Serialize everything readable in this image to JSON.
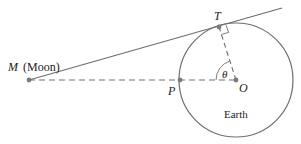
{
  "diagram": {
    "labels": {
      "moon_letter": "M",
      "moon_name": "(Moon)",
      "tangent_point": "T",
      "surface_point": "P",
      "center": "O",
      "angle": "θ",
      "body": "Earth"
    },
    "colors": {
      "line": "#6e6e6e",
      "dot": "#7a7a7a",
      "text": "#222222",
      "background": "#ffffff"
    },
    "geometry": {
      "moon": {
        "x": 29,
        "y": 80
      },
      "earth_center": {
        "x": 236,
        "y": 80
      },
      "earth_radius": 57,
      "tangent_point": {
        "x": 219,
        "y": 27
      },
      "surface_point": {
        "x": 180,
        "y": 80
      },
      "tangent_end": {
        "x": 282,
        "y": 8
      }
    }
  }
}
